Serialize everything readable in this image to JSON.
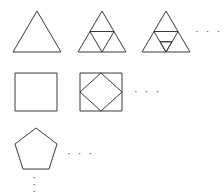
{
  "figure": {
    "background_color": "#ffffff",
    "stroke_color": "#3a3a3a",
    "width": 224,
    "height": 195
  },
  "rows": [
    {
      "name": "triangle-row",
      "shape": "triangle",
      "sides": 3,
      "label": "Triangles",
      "items": [
        {
          "name": "triangle-iteration-0",
          "iteration": 0,
          "description": "Plain equilateral triangle",
          "subdivisions": 0
        },
        {
          "name": "triangle-iteration-1",
          "iteration": 1,
          "description": "Triangle subdivided into four sub-triangles by midpoint lines",
          "subdivisions": 4
        },
        {
          "name": "triangle-iteration-2",
          "iteration": 2,
          "description": "Triangle subdivided twice, top sub-triangle divided again",
          "subdivisions": 7
        }
      ],
      "ellipsis": "· · ·"
    },
    {
      "name": "square-row",
      "shape": "square",
      "sides": 4,
      "label": "Squares",
      "items": [
        {
          "name": "square-iteration-0",
          "iteration": 0,
          "description": "Plain square",
          "subdivisions": 0
        },
        {
          "name": "square-iteration-1",
          "iteration": 1,
          "description": "Square with inscribed rotated square joining edge midpoints",
          "subdivisions": 5
        }
      ],
      "ellipsis": "· · ·"
    },
    {
      "name": "pentagon-row",
      "shape": "pentagon",
      "sides": 5,
      "label": "Pentagons",
      "items": [
        {
          "name": "pentagon-iteration-0",
          "iteration": 0,
          "description": "Plain regular pentagon",
          "subdivisions": 0
        }
      ],
      "ellipsis": "· · ·"
    }
  ],
  "vertical_ellipsis": {
    "name": "vertical-ellipsis",
    "dots": [
      "·",
      "·",
      "·"
    ]
  }
}
